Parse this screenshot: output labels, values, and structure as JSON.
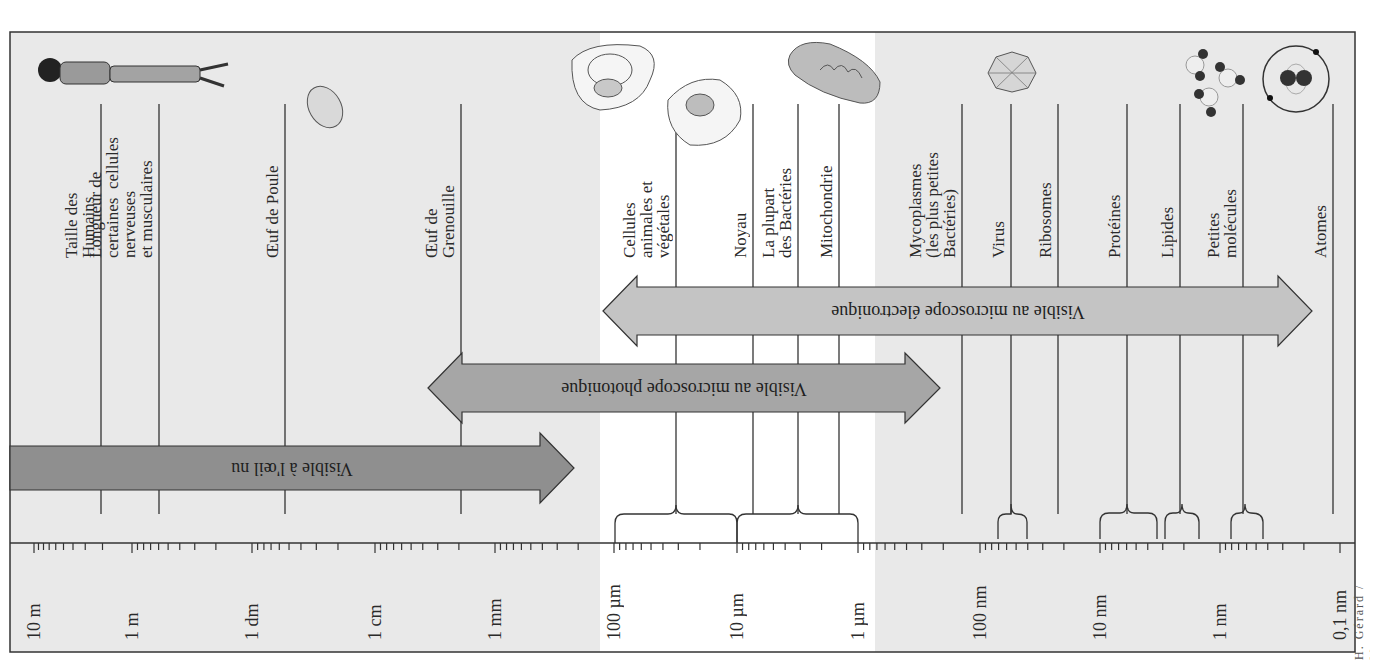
{
  "figure": {
    "colors": {
      "panel_gray": "#e9e9e9",
      "panel_white": "#ffffff",
      "arrow_eye": "#8f8f8f",
      "arrow_light": "#a6a6a6",
      "arrow_electron": "#c4c4c4",
      "line": "#333333"
    },
    "scale": {
      "ticks": [
        {
          "label": "10 m",
          "x": 34
        },
        {
          "label": "1 m",
          "x": 132
        },
        {
          "label": "1 dm",
          "x": 252
        },
        {
          "label": "1 cm",
          "x": 375
        },
        {
          "label": "1 mm",
          "x": 495
        },
        {
          "label": "100 µm",
          "x": 614
        },
        {
          "label": "10 µm",
          "x": 737
        },
        {
          "label": "1 µm",
          "x": 858
        },
        {
          "label": "100 nm",
          "x": 980
        },
        {
          "label": "10 nm",
          "x": 1100
        },
        {
          "label": "1 nm",
          "x": 1220
        },
        {
          "label": "0,1 nm",
          "x": 1340
        }
      ]
    },
    "objects": [
      {
        "label": "Taille des\nHumains",
        "x": 101,
        "icon": "human-figure"
      },
      {
        "label": "Longueur de\ncertaines  cellules\nnerveuses\net musculaires",
        "x": 159,
        "icon": ""
      },
      {
        "label": "Œuf de Poule",
        "x": 285,
        "icon": "egg"
      },
      {
        "label": "Œuf de\nGrenouille",
        "x": 461,
        "icon": ""
      },
      {
        "label": "Cellules\nanimales et\nvégétales",
        "x": 676,
        "icon": "cells"
      },
      {
        "label": "Noyau",
        "x": 753,
        "icon": ""
      },
      {
        "label": "La plupart\ndes Bactéries",
        "x": 798,
        "icon": ""
      },
      {
        "label": "Mitochondrie",
        "x": 839,
        "icon": "mitochondria"
      },
      {
        "label": "Mycoplasmes\n(les plus petites\nBactéries)",
        "x": 962,
        "icon": ""
      },
      {
        "label": "Virus",
        "x": 1011,
        "icon": "virus"
      },
      {
        "label": "Ribosomes",
        "x": 1058,
        "icon": ""
      },
      {
        "label": "Protéines",
        "x": 1127,
        "icon": ""
      },
      {
        "label": "Lipides",
        "x": 1180,
        "icon": "molecules"
      },
      {
        "label": "Petites\nmolécules",
        "x": 1243,
        "icon": ""
      },
      {
        "label": "Atomes",
        "x": 1333,
        "icon": "atom"
      }
    ],
    "arrows": [
      {
        "label": "Visible à l'œil nu",
        "x1": 10,
        "x2": 574
      },
      {
        "label": "Visible au microscope photonique",
        "x1": 428,
        "x2": 940
      },
      {
        "label": "Visible au microscope électronique",
        "x1": 603,
        "x2": 1312
      }
    ],
    "credit": "H. Gérard / Masson"
  }
}
